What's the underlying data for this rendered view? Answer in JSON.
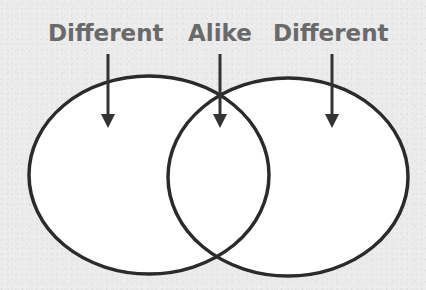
{
  "diagram": {
    "type": "venn",
    "labels": [
      {
        "text": "Different",
        "x": 48
      },
      {
        "text": "Alike",
        "x": 188
      },
      {
        "text": "Different",
        "x": 273
      }
    ],
    "colors": {
      "label": "#6a6a6a",
      "stroke": "#2b2b2b",
      "fill": "#ffffff",
      "background": "#ececec"
    },
    "sets": [
      {
        "name": "left-set",
        "region": "Different"
      },
      {
        "name": "right-set",
        "region": "Different"
      }
    ],
    "intersection": "Alike"
  }
}
